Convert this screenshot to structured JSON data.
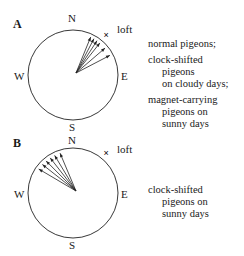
{
  "panels": [
    {
      "letter": "A",
      "compass": {
        "N": "N",
        "E": "E",
        "S": "S",
        "W": "W"
      },
      "loft_marker": "×",
      "loft_label": "loft",
      "loft_bearing_deg": 40,
      "vanishing_bearings_deg": [
        25,
        30,
        35,
        40,
        50,
        62
      ],
      "legend": [
        {
          "lines": [
            "normal pigeons;"
          ]
        },
        {
          "lines": [
            "clock-shifted",
            "pigeons",
            "on cloudy days;"
          ]
        },
        {
          "lines": [
            "magnet-carrying",
            "pigeons on",
            "sunny days"
          ]
        }
      ]
    },
    {
      "letter": "B",
      "compass": {
        "N": "N",
        "E": "E",
        "S": "S",
        "W": "W"
      },
      "loft_marker": "×",
      "loft_label": "loft",
      "loft_bearing_deg": 40,
      "vanishing_bearings_deg": [
        -18,
        -26,
        -33,
        -40,
        -47,
        -55
      ],
      "legend": [
        {
          "lines": [
            "clock-shifted",
            "pigeons on",
            "sunny days"
          ]
        }
      ]
    }
  ]
}
